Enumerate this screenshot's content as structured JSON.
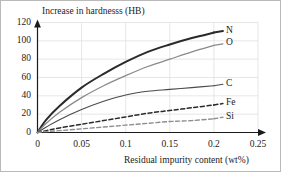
{
  "chart_data": {
    "type": "line",
    "title": "Increase in hardnesss (HB)",
    "xlabel": "Residual impurity content (wt%)",
    "ylabel": "Increase in hardnesss (HB)",
    "xlim": [
      0,
      0.25
    ],
    "ylim": [
      0,
      120
    ],
    "xticks": [
      "0",
      "0.05",
      "0.1",
      "0.15",
      "0.2",
      "0.25"
    ],
    "xtick_values": [
      0,
      0.05,
      0.1,
      0.15,
      0.2,
      0.25
    ],
    "yticks": [
      "0",
      "20",
      "40",
      "60",
      "80",
      "100",
      "120"
    ],
    "ytick_values": [
      0,
      20,
      40,
      60,
      80,
      100,
      120
    ],
    "grid": true,
    "legend_position": "right-inline-end-of-curve",
    "x": [
      0,
      0.01,
      0.025,
      0.05,
      0.075,
      0.1,
      0.125,
      0.15,
      0.175,
      0.2
    ],
    "series": [
      {
        "name": "N",
        "label": "N",
        "color": "#2a2a2a",
        "style": "solid",
        "width": 2.0,
        "values": [
          0,
          14,
          29,
          49,
          64,
          77,
          88,
          96,
          103,
          109
        ]
      },
      {
        "name": "O",
        "label": "O",
        "color": "#8a8a8a",
        "style": "solid",
        "width": 1.3,
        "values": [
          0,
          10,
          22,
          38,
          51,
          62,
          72,
          80,
          88,
          95
        ]
      },
      {
        "name": "C",
        "label": "C",
        "color": "#4a4a4a",
        "style": "solid",
        "width": 1.1,
        "values": [
          0,
          6,
          14,
          25,
          34,
          41,
          45,
          47,
          49,
          51
        ]
      },
      {
        "name": "Fe",
        "label": "Fe",
        "color": "#2a2a2a",
        "style": "dashed",
        "width": 1.5,
        "values": [
          0,
          2,
          5,
          9,
          13,
          17,
          21,
          24,
          27,
          30
        ]
      },
      {
        "name": "Si",
        "label": "Si",
        "color": "#8f8f8f",
        "style": "dashed",
        "width": 1.4,
        "values": [
          0,
          1,
          2,
          4,
          6,
          8,
          10,
          12,
          13,
          15
        ]
      }
    ]
  }
}
